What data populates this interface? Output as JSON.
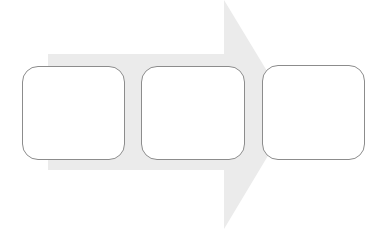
{
  "diagram": {
    "type": "process-arrow",
    "arrow_color": "#ebebeb",
    "box_border_color": "#8c8c8c",
    "steps": [
      {
        "label": ""
      },
      {
        "label": ""
      },
      {
        "label": ""
      }
    ]
  }
}
